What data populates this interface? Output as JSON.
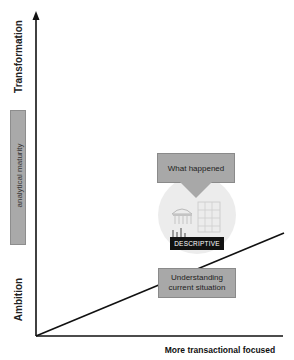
{
  "diagram": {
    "y_axis": {
      "top_label": "Transformation",
      "bottom_label": "Ambition",
      "side_bar_label": "analytical maturity"
    },
    "x_axis": {
      "label": "More transactional focused"
    },
    "stage": {
      "callout_top": "What happened",
      "badge": "DESCRIPTIVE",
      "callout_bottom": "Understanding current situation",
      "illustration": "building-chart-illustration"
    },
    "colors": {
      "axis": "#111111",
      "box_fill": "#a8a8a8",
      "badge_fill": "#111111",
      "badge_text": "#ffffff",
      "circle_fill": "#ececec"
    }
  }
}
